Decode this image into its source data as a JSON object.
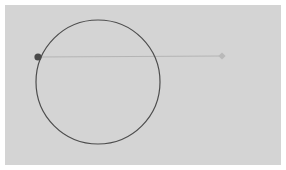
{
  "figure": {
    "width": 286,
    "height": 170,
    "background_color": "#ffffff",
    "panel": {
      "x": 5,
      "y": 5,
      "width": 276,
      "height": 160,
      "fill_color": "#d4d4d4"
    }
  },
  "chart_data": {
    "type": "scatter",
    "title": "",
    "subtitle": "",
    "xlabel": "",
    "ylabel": "",
    "grid": false,
    "legend_position": "none",
    "axis_visible": false,
    "tick_labels_x": [],
    "tick_labels_y": [],
    "xlim": [
      5,
      281
    ],
    "ylim": [
      5,
      165
    ],
    "shapes": [
      {
        "name": "main-circle",
        "type": "circle",
        "center_x": 98,
        "center_y": 82,
        "radius": 62,
        "fill": "none",
        "stroke_color": "#4d4d4d",
        "stroke_width": 1.2
      },
      {
        "name": "connector-line",
        "type": "line",
        "x1": 38,
        "y1": 57,
        "x2": 222,
        "y2": 56,
        "stroke_color": "#b0b0b0",
        "stroke_width": 0.9
      }
    ],
    "points": [
      {
        "name": "anchor-point",
        "label": "",
        "x": 38,
        "y": 57,
        "marker": "circle",
        "radius": 3.6,
        "color": "#4a4a4a"
      },
      {
        "name": "endpoint-marker",
        "label": "",
        "x": 222,
        "y": 56,
        "marker": "diamond",
        "radius": 3.6,
        "color": "#b9b9b9"
      }
    ]
  },
  "accessibility": {
    "figure_description": "A dark outlined circle on a light gray panel with a dark filled dot on its left edge connected by a faint horizontal line to a light gray diamond marker on the right."
  }
}
